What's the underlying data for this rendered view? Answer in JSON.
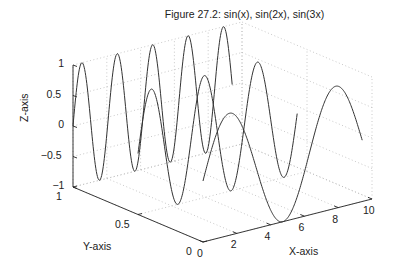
{
  "chart_data": {
    "type": "line",
    "subtype": "3d-line",
    "title": "Figure 27.2: sin(x), sin(2x), sin(3x)",
    "xlabel": "X-axis",
    "ylabel": "Y-axis",
    "zlabel": "Z-axis",
    "xlim": [
      0,
      10
    ],
    "ylim": [
      0,
      1
    ],
    "zlim": [
      -1,
      1
    ],
    "xticks": [
      "0",
      "2",
      "4",
      "6",
      "8",
      "10"
    ],
    "yticks": [
      "0",
      "0.5",
      "1"
    ],
    "zticks": [
      "-1",
      "-0.5",
      "0",
      "0.5",
      "1"
    ],
    "grid": true,
    "series": [
      {
        "name": "sin(x)",
        "y": 0,
        "freq": 1,
        "x_range": [
          0,
          9.42
        ]
      },
      {
        "name": "sin(2x)",
        "y": 0.5,
        "freq": 2,
        "x_range": [
          0,
          9.42
        ]
      },
      {
        "name": "sin(3x)",
        "y": 1,
        "freq": 3,
        "x_range": [
          0,
          9.42
        ]
      }
    ],
    "line_color": "#333333",
    "grid_color": "#bbbbbb"
  }
}
